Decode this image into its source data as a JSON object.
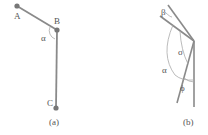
{
  "panel_a": {
    "caption": "(a)",
    "points": {
      "A": "A",
      "B": "B",
      "C": "C"
    },
    "angle_label": "α"
  },
  "panel_b": {
    "caption": "(b)",
    "angles": {
      "beta": "β",
      "sigma": "σ",
      "alpha": "α",
      "phi": "ϕ"
    }
  },
  "colors": {
    "line": "#8a8a8a",
    "point": "#777777",
    "arc": "#aaaaaa"
  }
}
